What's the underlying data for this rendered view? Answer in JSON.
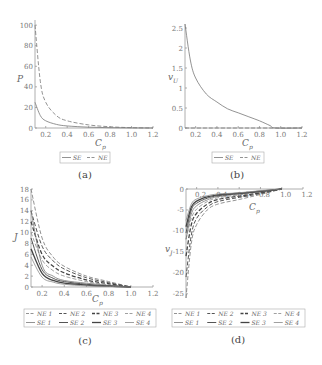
{
  "chart_data": [
    {
      "panel": "a",
      "caption": "(a)",
      "type": "line",
      "xlabel": "C_p",
      "ylabel": "P",
      "xlim": [
        0.1,
        1.2
      ],
      "ylim": [
        0,
        105
      ],
      "xticks": [
        "0.2",
        "0.4",
        "0.6",
        "0.8",
        "1.0",
        "1.2"
      ],
      "yticks": [
        "0",
        "20",
        "40",
        "60",
        "80",
        "100"
      ],
      "legend": [
        "SE",
        "NE"
      ],
      "legend_position": "bottom",
      "grid": false,
      "series": [
        {
          "name": "SE",
          "style": "solid",
          "x": [
            0.1,
            0.15,
            0.2,
            0.3,
            0.4,
            0.6,
            0.8,
            1.0,
            1.2
          ],
          "values": [
            25,
            12,
            7,
            3.5,
            2,
            0.8,
            0.3,
            0.1,
            0
          ]
        },
        {
          "name": "NE",
          "style": "dashed",
          "x": [
            0.1,
            0.15,
            0.2,
            0.3,
            0.4,
            0.6,
            0.8,
            1.0,
            1.2
          ],
          "values": [
            100,
            45,
            25,
            12,
            7,
            3,
            1.2,
            0.3,
            0
          ]
        }
      ]
    },
    {
      "panel": "b",
      "caption": "(b)",
      "type": "line",
      "xlabel": "C_p",
      "ylabel": "v_U",
      "xlim": [
        0.1,
        1.2
      ],
      "ylim": [
        0,
        2.6
      ],
      "xticks": [
        "0.2",
        "0.4",
        "0.6",
        "0.8",
        "1.0",
        "1.2"
      ],
      "yticks": [
        "0",
        "0.5",
        "1",
        "1.5",
        "2",
        "2.5"
      ],
      "legend": [
        "SE",
        "NE"
      ],
      "legend_position": "bottom",
      "grid": false,
      "series": [
        {
          "name": "SE",
          "style": "solid",
          "x": [
            0.1,
            0.15,
            0.2,
            0.3,
            0.4,
            0.5,
            0.6,
            0.7,
            0.8,
            0.9,
            0.95,
            1.2
          ],
          "values": [
            2.6,
            1.7,
            1.25,
            0.85,
            0.65,
            0.48,
            0.38,
            0.28,
            0.18,
            0.06,
            0,
            0
          ]
        },
        {
          "name": "NE",
          "style": "dashed",
          "x": [
            0.1,
            1.2
          ],
          "values": [
            0,
            0
          ]
        }
      ]
    },
    {
      "panel": "c",
      "caption": "(c)",
      "type": "line",
      "xlabel": "C_p",
      "ylabel": "J",
      "xlim": [
        0.1,
        1.2
      ],
      "ylim": [
        0,
        18
      ],
      "xticks": [
        "0.2",
        "0.4",
        "0.6",
        "0.8",
        "1.0",
        "1.2"
      ],
      "yticks": [
        "0",
        "2",
        "4",
        "6",
        "8",
        "10",
        "12",
        "14",
        "16",
        "18"
      ],
      "legend": [
        "NE 1",
        "NE 2",
        "NE 3",
        "NE 4",
        "SE 1",
        "SE 2",
        "SE 3",
        "SE 4"
      ],
      "legend_position": "bottom",
      "grid": false,
      "series": [
        {
          "name": "NE 1",
          "style": "dashed",
          "x": [
            0.1,
            0.2,
            0.3,
            0.4,
            0.6,
            0.8,
            1.0
          ],
          "values": [
            18,
            9,
            5.5,
            3.8,
            2,
            1,
            0
          ]
        },
        {
          "name": "NE 2",
          "style": "dashed",
          "x": [
            0.1,
            0.2,
            0.3,
            0.4,
            0.6,
            0.8,
            1.0
          ],
          "values": [
            14,
            7.5,
            4.8,
            3.3,
            1.7,
            0.8,
            0
          ]
        },
        {
          "name": "NE 3",
          "style": "dashed",
          "x": [
            0.1,
            0.2,
            0.3,
            0.4,
            0.6,
            0.8,
            1.0
          ],
          "values": [
            12,
            6,
            3.8,
            2.6,
            1.3,
            0.6,
            0
          ]
        },
        {
          "name": "NE 4",
          "style": "dashed",
          "x": [
            0.1,
            0.2,
            0.3,
            0.4,
            0.6,
            0.8,
            1.0
          ],
          "values": [
            10,
            5,
            3,
            2,
            1,
            0.4,
            0
          ]
        },
        {
          "name": "SE 1",
          "style": "solid",
          "x": [
            0.1,
            0.2,
            0.3,
            0.4,
            0.6,
            0.8,
            1.0
          ],
          "values": [
            14,
            4,
            2,
            1.2,
            0.7,
            0.3,
            0
          ]
        },
        {
          "name": "SE 2",
          "style": "solid",
          "x": [
            0.1,
            0.2,
            0.3,
            0.4,
            0.6,
            0.8,
            1.0
          ],
          "values": [
            9,
            3.2,
            1.6,
            1,
            0.5,
            0.2,
            0
          ]
        },
        {
          "name": "SE 3",
          "style": "solid",
          "x": [
            0.1,
            0.2,
            0.3,
            0.4,
            0.6,
            0.8,
            1.0
          ],
          "values": [
            7,
            2.5,
            1.2,
            0.7,
            0.35,
            0.15,
            0
          ]
        },
        {
          "name": "SE 4",
          "style": "solid",
          "x": [
            0.1,
            0.2,
            0.3,
            0.4,
            0.6,
            0.8,
            1.0
          ],
          "values": [
            5.5,
            1.8,
            0.9,
            0.5,
            0.2,
            0.1,
            0
          ]
        }
      ]
    },
    {
      "panel": "d",
      "caption": "(d)",
      "type": "line",
      "xlabel": "C_p",
      "ylabel": "v_J",
      "xlim": [
        0.1,
        1.2
      ],
      "ylim": [
        -26,
        0
      ],
      "xticks": [
        "0.2",
        "0.4",
        "0.6",
        "0.8",
        "1.0",
        "1.2"
      ],
      "yticks": [
        "0",
        "-5",
        "-10",
        "-15",
        "-20",
        "-25"
      ],
      "legend": [
        "NE 1",
        "NE 2",
        "NE 3",
        "NE 4",
        "SE 1",
        "SE 2",
        "SE 3",
        "SE 4"
      ],
      "legend_position": "bottom",
      "grid": false,
      "series": [
        {
          "name": "NE 1",
          "style": "dashed",
          "x": [
            0.1,
            0.15,
            0.2,
            0.3,
            0.4,
            0.6,
            0.8,
            1.0
          ],
          "values": [
            -26,
            -13,
            -8.5,
            -5,
            -3.6,
            -2.5,
            -1.3,
            0
          ]
        },
        {
          "name": "NE 2",
          "style": "dashed",
          "x": [
            0.1,
            0.15,
            0.2,
            0.3,
            0.4,
            0.6,
            0.8,
            1.0
          ],
          "values": [
            -21,
            -11,
            -7,
            -4.3,
            -3,
            -2,
            -1.1,
            0
          ]
        },
        {
          "name": "NE 3",
          "style": "dashed",
          "x": [
            0.1,
            0.15,
            0.2,
            0.3,
            0.4,
            0.6,
            0.8,
            1.0
          ],
          "values": [
            -16,
            -8.5,
            -5.8,
            -3.6,
            -2.5,
            -1.7,
            -0.9,
            0
          ]
        },
        {
          "name": "NE 4",
          "style": "dashed",
          "x": [
            0.1,
            0.15,
            0.2,
            0.3,
            0.4,
            0.6,
            0.8,
            1.0
          ],
          "values": [
            -12,
            -7,
            -4.8,
            -3,
            -2.1,
            -1.4,
            -0.7,
            0
          ]
        },
        {
          "name": "SE 1",
          "style": "solid",
          "x": [
            0.1,
            0.15,
            0.2,
            0.3,
            0.4,
            0.6,
            0.8,
            1.0
          ],
          "values": [
            -12,
            -6,
            -4,
            -2.6,
            -1.8,
            -1.2,
            -0.7,
            0
          ]
        },
        {
          "name": "SE 2",
          "style": "solid",
          "x": [
            0.1,
            0.15,
            0.2,
            0.3,
            0.4,
            0.6,
            0.8,
            1.0
          ],
          "values": [
            -10.5,
            -5,
            -3.4,
            -2.2,
            -1.6,
            -1.1,
            -0.6,
            0
          ]
        },
        {
          "name": "SE 3",
          "style": "solid",
          "x": [
            0.1,
            0.15,
            0.2,
            0.3,
            0.4,
            0.6,
            0.8,
            1.0
          ],
          "values": [
            -9,
            -4.3,
            -2.9,
            -1.9,
            -1.4,
            -1,
            -0.5,
            0
          ]
        },
        {
          "name": "SE 4",
          "style": "solid",
          "x": [
            0.1,
            0.15,
            0.2,
            0.3,
            0.4,
            0.6,
            0.8,
            1.0
          ],
          "values": [
            -7.5,
            -3.6,
            -2.4,
            -1.6,
            -1.2,
            -0.9,
            -0.4,
            0
          ]
        }
      ]
    }
  ]
}
